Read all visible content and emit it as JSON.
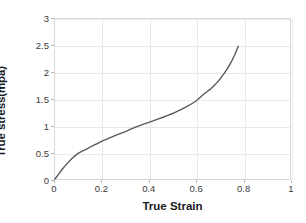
{
  "chart_data": {
    "type": "line",
    "title": "",
    "xlabel": "True Strain",
    "ylabel": "True stress(mpa)",
    "xlim": [
      0,
      1
    ],
    "ylim": [
      0,
      3
    ],
    "xticks": [
      "0",
      "0.2",
      "0.4",
      "0.6",
      "0.8",
      "1"
    ],
    "xtick_values": [
      0,
      0.2,
      0.4,
      0.6,
      0.8,
      1
    ],
    "yticks": [
      "0",
      "0.5",
      "1",
      "1.5",
      "2",
      "2.5",
      "3"
    ],
    "ytick_values": [
      0,
      0.5,
      1,
      1.5,
      2,
      2.5,
      3
    ],
    "grid": true,
    "legend": null,
    "line_color": "#595959",
    "line_width": 1.4,
    "series": [
      {
        "name": "True stress-strain curve",
        "x": [
          0.0,
          0.01,
          0.02,
          0.03,
          0.04,
          0.05,
          0.06,
          0.07,
          0.08,
          0.09,
          0.1,
          0.11,
          0.12,
          0.13,
          0.14,
          0.15,
          0.16,
          0.17,
          0.18,
          0.19,
          0.2,
          0.22,
          0.24,
          0.26,
          0.28,
          0.3,
          0.32,
          0.34,
          0.36,
          0.38,
          0.4,
          0.42,
          0.44,
          0.46,
          0.48,
          0.5,
          0.52,
          0.54,
          0.56,
          0.58,
          0.6,
          0.615,
          0.63,
          0.645,
          0.66,
          0.675,
          0.69,
          0.705,
          0.72,
          0.735,
          0.75,
          0.765,
          0.78
        ],
        "y": [
          0.0,
          0.06,
          0.12,
          0.178,
          0.232,
          0.283,
          0.33,
          0.374,
          0.415,
          0.452,
          0.486,
          0.51,
          0.53,
          0.551,
          0.576,
          0.6,
          0.622,
          0.643,
          0.664,
          0.686,
          0.708,
          0.748,
          0.786,
          0.822,
          0.856,
          0.89,
          0.93,
          0.966,
          1.0,
          1.032,
          1.063,
          1.094,
          1.126,
          1.158,
          1.192,
          1.228,
          1.268,
          1.31,
          1.356,
          1.406,
          1.462,
          1.52,
          1.58,
          1.63,
          1.68,
          1.742,
          1.812,
          1.89,
          1.98,
          2.08,
          2.195,
          2.33,
          2.49
        ]
      }
    ]
  }
}
